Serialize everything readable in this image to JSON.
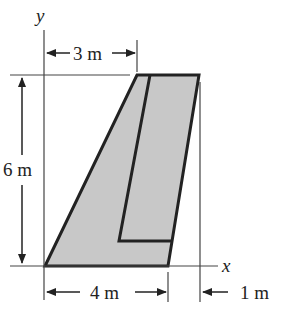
{
  "diagram": {
    "axes": {
      "x_label": "x",
      "y_label": "y"
    },
    "dimensions": {
      "top_offset": "3 m",
      "height": "6 m",
      "bottom_width": "4 m",
      "right_offset": "1 m"
    },
    "colors": {
      "fill": "#c8c8c8",
      "stroke": "#222222"
    }
  }
}
